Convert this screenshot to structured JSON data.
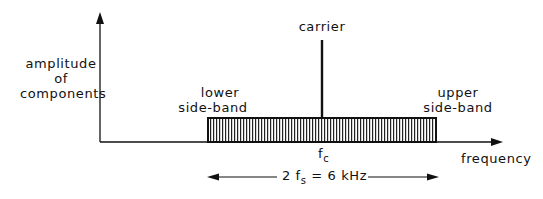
{
  "diagram": {
    "type": "frequency-spectrum-am",
    "y_axis_label": [
      "amplitude",
      "of",
      "components"
    ],
    "x_axis_label": "frequency",
    "carrier_label": "carrier",
    "carrier_freq_label": {
      "base": "f",
      "sub": "c"
    },
    "lower_sideband_label": [
      "lower",
      "side-band"
    ],
    "upper_sideband_label": [
      "upper",
      "side-band"
    ],
    "bandwidth_label": {
      "prefix": "2 f",
      "sub": "s",
      "suffix": " = 6 kHz"
    },
    "colors": {
      "ink": "#111111",
      "background": "#ffffff"
    }
  }
}
